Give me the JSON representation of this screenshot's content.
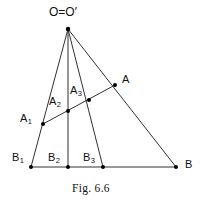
{
  "figure": {
    "caption": "Fig. 6.6",
    "stroke_color": "#1a1a1a",
    "point_color": "#000000",
    "background": "#ffffff",
    "width": 202,
    "height": 202,
    "apex": {
      "name": "O",
      "label": "O=O′",
      "x": 68,
      "y": 29
    },
    "points": [
      {
        "id": "A",
        "label": "A",
        "sub": "",
        "x": 115,
        "y": 85,
        "label_x": 122,
        "label_y": 74
      },
      {
        "id": "A1",
        "label": "A",
        "sub": "1",
        "x": 43,
        "y": 124,
        "label_x": 20,
        "label_y": 113
      },
      {
        "id": "A2",
        "label": "A",
        "sub": "2",
        "x": 68,
        "y": 111,
        "label_x": 49,
        "label_y": 96
      },
      {
        "id": "A3",
        "label": "A",
        "sub": "3",
        "x": 89,
        "y": 100,
        "label_x": 70,
        "label_y": 85
      },
      {
        "id": "B",
        "label": "B",
        "sub": "",
        "x": 176,
        "y": 167,
        "label_x": 185,
        "label_y": 159
      },
      {
        "id": "B1",
        "label": "B",
        "sub": "1",
        "x": 31,
        "y": 167,
        "label_x": 12,
        "label_y": 152
      },
      {
        "id": "B2",
        "label": "B",
        "sub": "2",
        "x": 68,
        "y": 167,
        "label_x": 48,
        "label_y": 152
      },
      {
        "id": "B3",
        "label": "B",
        "sub": "3",
        "x": 103,
        "y": 167,
        "label_x": 83,
        "label_y": 152
      }
    ],
    "segments": [
      {
        "id": "ray-O-B1",
        "x1": 68,
        "y1": 29,
        "x2": 31,
        "y2": 167
      },
      {
        "id": "ray-O-B2",
        "x1": 68,
        "y1": 29,
        "x2": 68,
        "y2": 167
      },
      {
        "id": "ray-O-B3",
        "x1": 68,
        "y1": 29,
        "x2": 103,
        "y2": 167
      },
      {
        "id": "ray-O-B",
        "x1": 68,
        "y1": 29,
        "x2": 176,
        "y2": 167
      },
      {
        "id": "base-B1-B",
        "x1": 31,
        "y1": 167,
        "x2": 176,
        "y2": 167
      },
      {
        "id": "transversal-A1-A",
        "x1": 43,
        "y1": 124,
        "x2": 115,
        "y2": 85
      }
    ]
  }
}
